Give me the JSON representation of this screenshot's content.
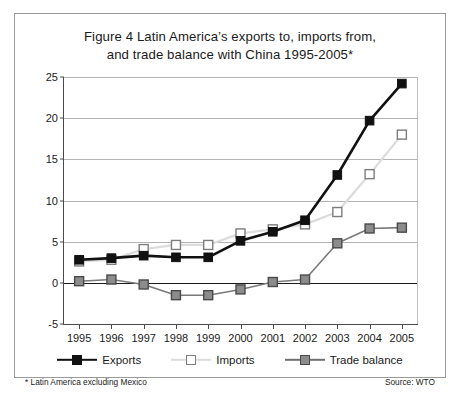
{
  "figure": {
    "title_line1": "Figure 4 Latin America’s exports to, imports from,",
    "title_line2": "and trade balance with China 1995-2005*",
    "footnote": "* Latin America excluding Mexico",
    "source": "Source: WTO"
  },
  "colors": {
    "exports": "#111111",
    "imports": "#d9d9d9",
    "imports_marker_edge": "#777777",
    "trade_balance": "#8c8c8c",
    "trade_balance_edge": "#4a4a4a",
    "axis": "#4a4a4a",
    "grid": "#b4b4b4",
    "zero_line": "#1a1a1a",
    "frame": "#9a9a9a",
    "background": "#ffffff"
  },
  "legend": {
    "items": [
      {
        "label": "Exports",
        "key": "exports"
      },
      {
        "label": "Imports",
        "key": "imports"
      },
      {
        "label": "Trade balance",
        "key": "trade_balance"
      }
    ]
  },
  "chart_data": {
    "type": "line",
    "title": "Figure 4 Latin America’s exports to, imports from, and trade balance with China 1995-2005*",
    "subtitle": "",
    "xlabel": "",
    "ylabel": "",
    "categories": [
      "1995",
      "1996",
      "1997",
      "1998",
      "1999",
      "2000",
      "2001",
      "2002",
      "2003",
      "2004",
      "2005"
    ],
    "x": [
      1995,
      1996,
      1997,
      1998,
      1999,
      2000,
      2001,
      2002,
      2003,
      2004,
      2005
    ],
    "series": [
      {
        "name": "Exports",
        "values": [
          2.8,
          3.0,
          3.3,
          3.1,
          3.1,
          5.1,
          6.2,
          7.6,
          13.1,
          19.7,
          24.2
        ],
        "color": "#111111",
        "marker": "filled-square"
      },
      {
        "name": "Imports",
        "values": [
          2.6,
          2.8,
          4.1,
          4.6,
          4.6,
          6.0,
          6.5,
          7.1,
          8.6,
          13.2,
          18.0
        ],
        "color": "#d9d9d9",
        "marker": "open-square"
      },
      {
        "name": "Trade balance",
        "values": [
          0.2,
          0.4,
          -0.2,
          -1.5,
          -1.5,
          -0.8,
          0.1,
          0.4,
          4.8,
          6.6,
          6.7
        ],
        "color": "#8c8c8c",
        "marker": "gray-square"
      }
    ],
    "ylim": [
      -5,
      25
    ],
    "yticks": [
      -5,
      0,
      5,
      10,
      15,
      20,
      25
    ],
    "ytick_labels": [
      "-5",
      "0",
      "5",
      "10",
      "15",
      "20",
      "25"
    ],
    "grid": true,
    "grid_axis": "y",
    "legend_position": "bottom",
    "annotations": [
      "* Latin America excluding Mexico",
      "Source: WTO"
    ],
    "units": "US$ billion"
  }
}
